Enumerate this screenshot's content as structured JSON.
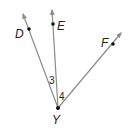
{
  "diagram": {
    "type": "geometry-rays",
    "vertex": {
      "label": "Y",
      "x": 58,
      "y": 108
    },
    "rays": [
      {
        "name": "YD",
        "point_label": "D",
        "point": {
          "x": 29,
          "y": 29
        },
        "tip": {
          "x": 23,
          "y": 14
        }
      },
      {
        "name": "YE",
        "point_label": "E",
        "point": {
          "x": 53,
          "y": 24
        },
        "tip": {
          "x": 52,
          "y": 10
        }
      },
      {
        "name": "YF",
        "point_label": "F",
        "point": {
          "x": 113,
          "y": 44
        },
        "tip": {
          "x": 121,
          "y": 33
        }
      }
    ],
    "angles": [
      {
        "label": "3",
        "between": [
          "YD",
          "YE"
        ]
      },
      {
        "label": "4",
        "between": [
          "YE",
          "YF"
        ]
      }
    ],
    "colors": {
      "line": "#8a8a8a",
      "point": "#111111",
      "text": "#222222"
    }
  }
}
